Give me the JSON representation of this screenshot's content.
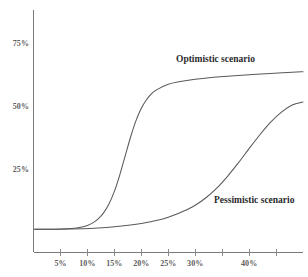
{
  "chart_data": {
    "type": "line",
    "title": "",
    "subtitle": "",
    "xlabel": "",
    "ylabel": "",
    "grid": false,
    "legend_position": "inline-annotation",
    "xlim": [
      0,
      50
    ],
    "ylim": [
      0,
      100
    ],
    "x_tick_labels": [
      "5%",
      "10%",
      "15%",
      "20%",
      "25%",
      "30%",
      "40%"
    ],
    "x_tick_values": [
      5,
      10,
      15,
      20,
      25,
      30,
      40
    ],
    "y_tick_labels": [
      "75%",
      "50%",
      "25%"
    ],
    "y_tick_values": [
      75,
      50,
      25
    ],
    "series": [
      {
        "name": "Optimistic scenario",
        "color": "#595959",
        "annotation": "Optimistic scenario",
        "x": [
          1,
          3,
          5,
          7,
          8,
          9,
          10,
          11,
          12,
          13,
          14,
          15,
          16,
          17,
          18,
          19,
          20,
          21,
          22,
          23,
          25,
          27,
          30,
          33,
          36,
          40,
          44,
          48,
          50
        ],
        "values": [
          1.5,
          1.5,
          1.6,
          1.8,
          2.0,
          2.4,
          3.0,
          4.0,
          5.6,
          8.0,
          11.5,
          16.5,
          23.0,
          30.5,
          38.0,
          44.5,
          49.5,
          53.0,
          55.5,
          57.0,
          59.0,
          60.0,
          61.0,
          61.7,
          62.2,
          62.8,
          63.3,
          63.8,
          64.0
        ]
      },
      {
        "name": "Pessimistic scenario",
        "color": "#595959",
        "annotation": "Pessimistic scenario",
        "x": [
          1,
          5,
          9,
          12,
          15,
          18,
          20,
          22,
          24,
          26,
          28,
          30,
          32,
          34,
          36,
          38,
          40,
          42,
          44,
          46,
          48,
          50
        ],
        "values": [
          1.5,
          1.5,
          1.7,
          2.0,
          2.5,
          3.2,
          3.8,
          4.6,
          5.6,
          7.0,
          8.8,
          11.0,
          14.0,
          17.8,
          22.5,
          27.8,
          33.5,
          39.0,
          44.0,
          48.0,
          50.8,
          52.0
        ]
      }
    ]
  }
}
